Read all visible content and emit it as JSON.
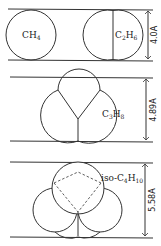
{
  "figure": {
    "type": "molecular-diameter-comparison",
    "panels": [
      {
        "id": "panel-1",
        "molecules": [
          {
            "formula": "CH4",
            "label_main": "CH",
            "label_sub": "4"
          },
          {
            "formula": "C2H6",
            "label_parts": [
              "C",
              "2",
              "H",
              "6"
            ]
          }
        ],
        "dimension": "4.0A"
      },
      {
        "id": "panel-2",
        "molecules": [
          {
            "formula": "C3H8",
            "label_parts": [
              "C",
              "3",
              "H",
              "8"
            ]
          }
        ],
        "dimension": "4.89A"
      },
      {
        "id": "panel-3",
        "molecules": [
          {
            "formula": "iso-C4H10",
            "label_parts": [
              "iso-C",
              "4",
              "H",
              "10"
            ]
          }
        ],
        "dimension": "5.58A"
      }
    ]
  }
}
